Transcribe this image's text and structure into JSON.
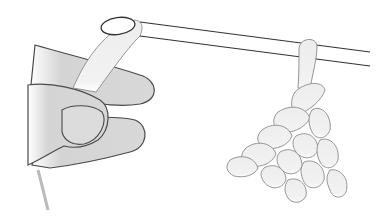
{
  "illustration": {
    "subject": "hand holding yarn loop with crochet hook and hanging stitches",
    "colors": {
      "background": "#ffffff",
      "outline": "#4a4a4a",
      "skin_fill": "#d6d6d6",
      "skin_shadow": "#c4c4c4",
      "yarn_fill": "#ececec",
      "yarn_outline": "#8a8a8a",
      "hook_line": "#333333"
    }
  }
}
